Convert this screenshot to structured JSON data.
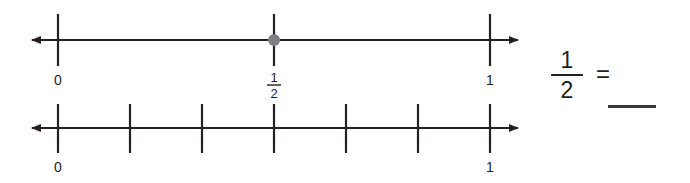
{
  "page": {
    "background_color": "#ffffff",
    "width": 690,
    "height": 183
  },
  "colors": {
    "line": "#231f20",
    "text": "#231f20",
    "point_fill": "#808083",
    "blank_line": "#3a3a3c"
  },
  "number_lines": [
    {
      "name": "top-number-line",
      "y": 40,
      "start_label": "0",
      "end_label": "1",
      "divisions": 2,
      "tick_labels": [
        "0",
        "1/2",
        "1"
      ],
      "point": {
        "label_numerator": "1",
        "label_denominator": "2",
        "value": 0.5,
        "color": "#808083"
      },
      "left_arrow": true,
      "right_arrow": true,
      "labels": [
        {
          "text": "0",
          "value": 0
        },
        {
          "numerator": "1",
          "denominator": "2",
          "value": 0.5
        },
        {
          "text": "1",
          "value": 1
        }
      ]
    },
    {
      "name": "bottom-number-line",
      "y": 128,
      "start_label": "0",
      "end_label": "1",
      "divisions": 6,
      "tick_labels": [
        "0",
        "",
        "",
        "",
        "",
        "",
        "1"
      ],
      "point": null,
      "left_arrow": true,
      "right_arrow": true,
      "labels": [
        {
          "text": "0",
          "value": 0
        },
        {
          "text": "1",
          "value": 1
        }
      ]
    }
  ],
  "equation": {
    "left_fraction": {
      "numerator": "1",
      "denominator": "2"
    },
    "operator": "=",
    "answer": ""
  }
}
